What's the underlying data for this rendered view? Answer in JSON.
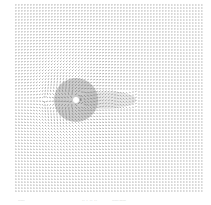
{
  "chart_data": {
    "type": "quiver",
    "title": "",
    "xlabel": "",
    "ylabel": "",
    "grid": false,
    "legend": null,
    "domain_px": {
      "x0": 15,
      "y0": 5,
      "x1": 201,
      "y1": 191
    },
    "obstacle": {
      "shape": "circle",
      "cx": 76,
      "cy": 100,
      "r": 3,
      "color": "#ffffff"
    },
    "wake": {
      "direction": "+x",
      "length_px": 60,
      "half_width_px": 9
    },
    "freestream_direction": "+x",
    "arrow_color": "#555555",
    "grid_spacing_px": 3
  },
  "caption": {
    "left": "------",
    "middle": "-- - -- --",
    "right": "------ ------"
  }
}
